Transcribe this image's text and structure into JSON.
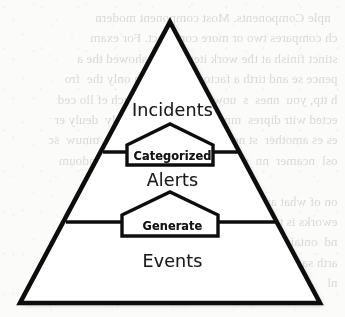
{
  "diagram": {
    "type": "pyramid",
    "orientation": "apex-up",
    "tiers": [
      {
        "id": "incidents",
        "label": "Incidents",
        "level": 1,
        "position": "top"
      },
      {
        "id": "alerts",
        "label": "Alerts",
        "level": 2,
        "position": "middle"
      },
      {
        "id": "events",
        "label": "Events",
        "level": 3,
        "position": "bottom"
      }
    ],
    "transitions": [
      {
        "id": "categorized",
        "label": "Categorized",
        "from": "alerts",
        "to": "incidents"
      },
      {
        "id": "generate",
        "label": "Generate",
        "from": "events",
        "to": "alerts"
      }
    ],
    "colors": {
      "outline": "#111111",
      "fill": "#ffffff",
      "shadow": "#b9b9b9",
      "text": "#1b1b1b",
      "paper": "#fbfbf9"
    }
  },
  "background": {
    "kind": "scanned-paper-bleed-through",
    "note": "Faint mirrored text showing through from the reverse side of the page; illegible texture, not readable content."
  }
}
